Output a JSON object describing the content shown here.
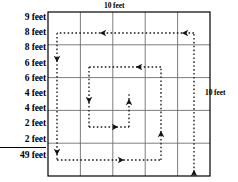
{
  "figure": {
    "title_top": "10 feet",
    "title_right": "10 feet",
    "lengths": [
      {
        "label": "9 feet",
        "value": 9,
        "unit": "feet"
      },
      {
        "label": "8 feet",
        "value": 8,
        "unit": "feet"
      },
      {
        "label": "8 feet",
        "value": 8,
        "unit": "feet"
      },
      {
        "label": "6 feet",
        "value": 6,
        "unit": "feet"
      },
      {
        "label": "6 feet",
        "value": 6,
        "unit": "feet"
      },
      {
        "label": "4 feet",
        "value": 4,
        "unit": "feet"
      },
      {
        "label": "4 feet",
        "value": 4,
        "unit": "feet"
      },
      {
        "label": "2 feet",
        "value": 2,
        "unit": "feet"
      },
      {
        "label": "2 feet",
        "value": 2,
        "unit": "feet"
      }
    ],
    "total": {
      "label": "49 feet",
      "value": 49,
      "unit": "feet"
    },
    "grid": {
      "rows": 5,
      "cols": 5,
      "width_feet": 10,
      "height_feet": 10,
      "cell_feet": 2,
      "line_color": "#6f6f6f",
      "border_color": "#000000"
    },
    "path": {
      "style": "dotted",
      "color": "#1a1a1a",
      "direction": "counterclockwise-inward-spiral",
      "arrow_directions": [
        "left",
        "left",
        "down",
        "left",
        "down",
        "down",
        "right",
        "up",
        "up",
        "up"
      ]
    }
  }
}
